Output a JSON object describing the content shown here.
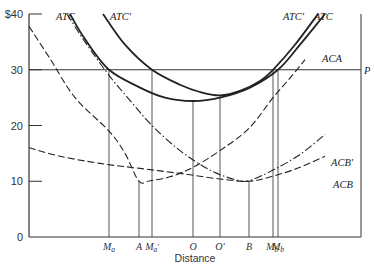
{
  "chart_data": {
    "type": "line",
    "title": "",
    "xlabel": "Distance",
    "ylabel": "",
    "ylim": [
      0,
      40
    ],
    "yticks": [
      {
        "value": 0,
        "label": "0"
      },
      {
        "value": 10,
        "label": "10"
      },
      {
        "value": 20,
        "label": "20"
      },
      {
        "value": 30,
        "label": "30"
      },
      {
        "value": 40,
        "label": "$40"
      }
    ],
    "x_markers": [
      {
        "label": "Ma",
        "sub": "a",
        "x": 109
      },
      {
        "label": "A",
        "sub": "",
        "x": 139
      },
      {
        "label": "Ma'",
        "sub": "a'",
        "x": 152
      },
      {
        "label": "O",
        "sub": "",
        "x": 193
      },
      {
        "label": "O'",
        "sub": "",
        "x": 220
      },
      {
        "label": "B",
        "sub": "",
        "x": 249
      },
      {
        "label": "Mb'",
        "sub": "b'",
        "x": 273
      },
      {
        "label": "Mb",
        "sub": "b",
        "x": 278
      }
    ],
    "price_line": {
      "label": "P",
      "value": 30
    },
    "series": [
      {
        "name": "ATC",
        "style": "solid",
        "points": [
          [
            70,
            40
          ],
          [
            85,
            35.5
          ],
          [
            109,
            30
          ],
          [
            140,
            26.8
          ],
          [
            165,
            25
          ],
          [
            193,
            24.4
          ],
          [
            220,
            25
          ],
          [
            250,
            26.8
          ],
          [
            278,
            30
          ],
          [
            300,
            34.5
          ],
          [
            325,
            40
          ]
        ]
      },
      {
        "name": "ATC'",
        "style": "solid",
        "points": [
          [
            103,
            40
          ],
          [
            125,
            34.5
          ],
          [
            152,
            30
          ],
          [
            180,
            27.3
          ],
          [
            200,
            26
          ],
          [
            220,
            25.4
          ],
          [
            240,
            26.2
          ],
          [
            260,
            28
          ],
          [
            273,
            30
          ],
          [
            295,
            34.5
          ],
          [
            318,
            40
          ]
        ]
      },
      {
        "name": "ACA",
        "style": "dashed",
        "points": [
          [
            29,
            37.8
          ],
          [
            50,
            32
          ],
          [
            75,
            25
          ],
          [
            109,
            19
          ],
          [
            125,
            15
          ],
          [
            139,
            10
          ],
          [
            150,
            10.1
          ],
          [
            170,
            10.8
          ],
          [
            193,
            12.5
          ],
          [
            220,
            15.5
          ],
          [
            249,
            19.5
          ],
          [
            273,
            25
          ],
          [
            290,
            28.5
          ],
          [
            305,
            31.8
          ]
        ]
      },
      {
        "name": "ACB",
        "style": "dashed",
        "points": [
          [
            29,
            16
          ],
          [
            60,
            14.5
          ],
          [
            100,
            13.2
          ],
          [
            140,
            12.3
          ],
          [
            180,
            11.4
          ],
          [
            220,
            10.4
          ],
          [
            249,
            10
          ],
          [
            273,
            10.9
          ],
          [
            300,
            12.5
          ],
          [
            325,
            14.5
          ]
        ]
      },
      {
        "name": "ACB'",
        "style": "dash-dot",
        "points": [
          [
            67,
            40
          ],
          [
            85,
            35
          ],
          [
            109,
            29
          ],
          [
            130,
            24.5
          ],
          [
            152,
            20
          ],
          [
            180,
            15.5
          ],
          [
            210,
            12
          ],
          [
            235,
            10.3
          ],
          [
            249,
            10.1
          ],
          [
            273,
            12
          ],
          [
            300,
            14.8
          ],
          [
            325,
            18.4
          ]
        ]
      }
    ],
    "series_labels": [
      {
        "name": "ATC",
        "x": 56,
        "y": 20
      },
      {
        "name": "ATC'",
        "x": 110,
        "y": 20
      },
      {
        "name": "ATC'",
        "x": 283,
        "y": 20
      },
      {
        "name": "ATC",
        "x": 314,
        "y": 20
      },
      {
        "name": "ACA",
        "x": 322,
        "y": 62
      },
      {
        "name": "ACB'",
        "x": 331,
        "y": 166
      },
      {
        "name": "ACB",
        "x": 333,
        "y": 188
      }
    ],
    "grid": false,
    "legend": "inline labels"
  },
  "colors": {
    "axis": "#333333",
    "curve": "#222222",
    "guide": "#444444"
  }
}
